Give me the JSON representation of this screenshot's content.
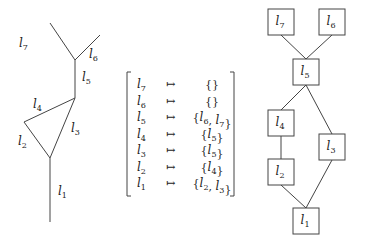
{
  "tree": {
    "edges": [
      {
        "id": "l7",
        "label": "l",
        "sub": "7",
        "x1": 50,
        "y1": 23,
        "x2": 75,
        "y2": 60,
        "lx": 19,
        "ly": 47
      },
      {
        "id": "l6",
        "label": "l",
        "sub": "6",
        "x1": 100,
        "y1": 35,
        "x2": 75,
        "y2": 60,
        "lx": 89,
        "ly": 58
      },
      {
        "id": "l5",
        "label": "l",
        "sub": "5",
        "x1": 75,
        "y1": 60,
        "x2": 75,
        "y2": 98,
        "lx": 82,
        "ly": 81
      },
      {
        "id": "l4",
        "label": "l",
        "sub": "4",
        "x1": 75,
        "y1": 98,
        "x2": 24,
        "y2": 122,
        "lx": 33,
        "ly": 108
      },
      {
        "id": "l3",
        "label": "l",
        "sub": "3",
        "x1": 75,
        "y1": 98,
        "x2": 50,
        "y2": 158,
        "lx": 71,
        "ly": 132
      },
      {
        "id": "l2",
        "label": "l",
        "sub": "2",
        "x1": 24,
        "y1": 122,
        "x2": 50,
        "y2": 158,
        "lx": 18,
        "ly": 145
      },
      {
        "id": "l1",
        "label": "l",
        "sub": "1",
        "x1": 50,
        "y1": 158,
        "x2": 50,
        "y2": 222,
        "lx": 58,
        "ly": 195
      }
    ]
  },
  "mapping": {
    "arrow": "↦",
    "rows": [
      {
        "key": "l",
        "key_sub": "7",
        "value_parts": [
          {
            "t": "{}"
          }
        ]
      },
      {
        "key": "l",
        "key_sub": "6",
        "value_parts": [
          {
            "t": "{}"
          }
        ]
      },
      {
        "key": "l",
        "key_sub": "5",
        "value_parts": [
          {
            "t": "{"
          },
          {
            "l": "l",
            "s": "6"
          },
          {
            "t": ", "
          },
          {
            "l": "l",
            "s": "7"
          },
          {
            "t": "}"
          }
        ]
      },
      {
        "key": "l",
        "key_sub": "4",
        "value_parts": [
          {
            "t": "{"
          },
          {
            "l": "l",
            "s": "5"
          },
          {
            "t": "}"
          }
        ]
      },
      {
        "key": "l",
        "key_sub": "3",
        "value_parts": [
          {
            "t": "{"
          },
          {
            "l": "l",
            "s": "5"
          },
          {
            "t": "}"
          }
        ]
      },
      {
        "key": "l",
        "key_sub": "2",
        "value_parts": [
          {
            "t": "{"
          },
          {
            "l": "l",
            "s": "4"
          },
          {
            "t": "}"
          }
        ]
      },
      {
        "key": "l",
        "key_sub": "1",
        "value_parts": [
          {
            "t": "{"
          },
          {
            "l": "l",
            "s": "2"
          },
          {
            "t": ", "
          },
          {
            "l": "l",
            "s": "3"
          },
          {
            "t": "}"
          }
        ]
      }
    ]
  },
  "graph": {
    "nodes": [
      {
        "id": "l7",
        "label": "l",
        "sub": "7",
        "x": 268,
        "y": 9
      },
      {
        "id": "l6",
        "label": "l",
        "sub": "6",
        "x": 319,
        "y": 9
      },
      {
        "id": "l5",
        "label": "l",
        "sub": "5",
        "x": 293,
        "y": 59
      },
      {
        "id": "l4",
        "label": "l",
        "sub": "4",
        "x": 268,
        "y": 110
      },
      {
        "id": "l3",
        "label": "l",
        "sub": "3",
        "x": 319,
        "y": 134
      },
      {
        "id": "l2",
        "label": "l",
        "sub": "2",
        "x": 268,
        "y": 159
      },
      {
        "id": "l1",
        "label": "l",
        "sub": "1",
        "x": 293,
        "y": 208
      }
    ],
    "node_size": 26,
    "edges": [
      [
        "l7",
        "l5"
      ],
      [
        "l6",
        "l5"
      ],
      [
        "l5",
        "l4"
      ],
      [
        "l5",
        "l3"
      ],
      [
        "l4",
        "l2"
      ],
      [
        "l2",
        "l1"
      ],
      [
        "l3",
        "l1"
      ]
    ]
  }
}
